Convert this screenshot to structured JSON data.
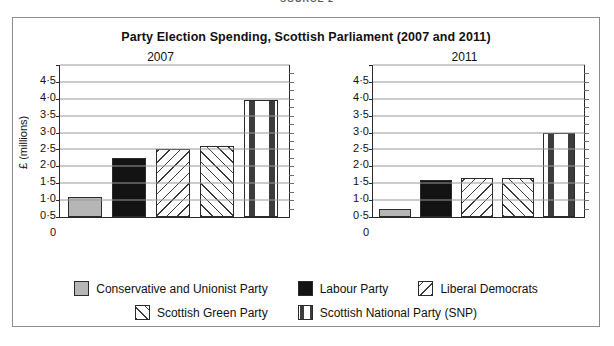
{
  "source_caption": "SOURCE 2",
  "figure": {
    "title": "Party Election Spending, Scottish Parliament (2007 and 2011)",
    "ylabel": "£ (millions)"
  },
  "chart_data": {
    "type": "bar",
    "title": "Party Election Spending, Scottish Parliament (2007 and 2011)",
    "xlabel": "",
    "ylabel": "£ (millions)",
    "ylim": [
      0,
      4.5
    ],
    "ytick_labels": [
      "4·5",
      "4·0",
      "3·5",
      "3·0",
      "2·5",
      "2·0",
      "1·5",
      "1·0",
      "0·5",
      "0"
    ],
    "yticks": [
      4.5,
      4.0,
      3.5,
      3.0,
      2.5,
      2.0,
      1.5,
      1.0,
      0.5,
      0
    ],
    "grid": true,
    "legend_position": "bottom",
    "categories": [
      "Conservative and Unionist Party",
      "Labour Party",
      "Liberal Democrats",
      "Scottish Green Party",
      "Scottish National Party (SNP)"
    ],
    "panels": [
      {
        "label": "2007",
        "values": [
          0.6,
          1.75,
          2.0,
          2.1,
          3.45
        ]
      },
      {
        "label": "2011",
        "values": [
          0.25,
          1.1,
          1.15,
          1.15,
          2.5
        ]
      }
    ]
  },
  "legend": {
    "rows": [
      [
        {
          "label": "Conservative and Unionist Party",
          "pattern": "solid-grey",
          "color": "#b6b6b6"
        },
        {
          "label": "Labour Party",
          "pattern": "solid-black",
          "color": "#131313"
        },
        {
          "label": "Liberal Democrats",
          "pattern": "diag-sparse",
          "color": "#ffffff"
        }
      ],
      [
        {
          "label": "Scottish Green Party",
          "pattern": "diag-dense",
          "color": "#ffffff"
        },
        {
          "label": "Scottish National Party (SNP)",
          "pattern": "dashes",
          "color": "#ffffff"
        }
      ]
    ]
  }
}
